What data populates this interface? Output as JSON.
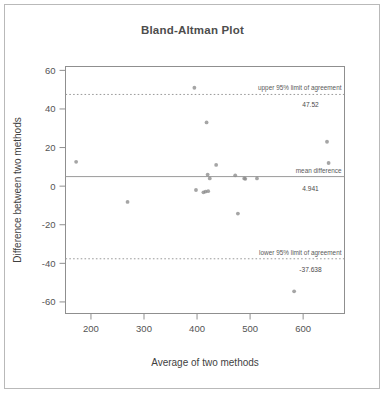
{
  "chart_data": {
    "type": "scatter",
    "title": "Bland-Altman Plot",
    "xlabel": "Average of two methods",
    "ylabel": "Difference between two methods",
    "xlim": [
      152,
      678
    ],
    "ylim": [
      -66,
      62
    ],
    "xticks": [
      200,
      300,
      400,
      500,
      600
    ],
    "yticks": [
      60,
      40,
      20,
      0,
      -20,
      -40,
      -60
    ],
    "xticklabels": [
      "200",
      "300",
      "400",
      "500",
      "600"
    ],
    "yticklabels": [
      "60",
      "40",
      "20",
      "0",
      "-20",
      "-40",
      "-60"
    ],
    "grid": false,
    "legend": "none",
    "point_color": "#8c8c8c",
    "line_color": "#9a9a9a",
    "x": [
      172,
      269,
      395,
      398,
      412,
      416,
      418,
      420,
      421,
      424,
      436,
      472,
      477,
      489,
      491,
      513,
      583,
      645,
      648
    ],
    "y": [
      12.6,
      -8.2,
      51.0,
      -2.0,
      -3.2,
      -2.8,
      33.0,
      6.0,
      -2.6,
      4.0,
      11.0,
      5.6,
      -14.2,
      4.0,
      3.8,
      4.0,
      -54.5,
      23.0,
      12.0
    ],
    "series": [
      {
        "name": "differences",
        "points": [
          {
            "x": 172,
            "y": 12.6
          },
          {
            "x": 269,
            "y": -8.2
          },
          {
            "x": 395,
            "y": 51.0
          },
          {
            "x": 398,
            "y": -2.0
          },
          {
            "x": 412,
            "y": -3.2
          },
          {
            "x": 416,
            "y": -2.8
          },
          {
            "x": 418,
            "y": 33.0
          },
          {
            "x": 420,
            "y": 6.0
          },
          {
            "x": 421,
            "y": -2.6
          },
          {
            "x": 424,
            "y": 4.0
          },
          {
            "x": 436,
            "y": 11.0
          },
          {
            "x": 472,
            "y": 5.6
          },
          {
            "x": 477,
            "y": -14.2
          },
          {
            "x": 489,
            "y": 4.0
          },
          {
            "x": 491,
            "y": 3.8
          },
          {
            "x": 513,
            "y": 4.0
          },
          {
            "x": 583,
            "y": -54.5
          },
          {
            "x": 645,
            "y": 23.0
          },
          {
            "x": 648,
            "y": 12.0
          }
        ]
      }
    ],
    "reference_lines": [
      {
        "id": "upper",
        "value": 47.52,
        "label": "upper 95% limit of agreement",
        "value_label": "47.52",
        "style": "dotted"
      },
      {
        "id": "mean",
        "value": 4.941,
        "label": "mean difference",
        "value_label": "4.941",
        "style": "solid"
      },
      {
        "id": "lower",
        "value": -37.638,
        "label": "lower 95% limit of agreement",
        "value_label": "-37.638",
        "style": "dotted"
      }
    ]
  }
}
